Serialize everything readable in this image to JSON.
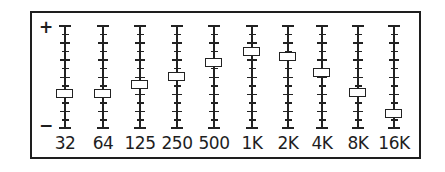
{
  "equalizer": {
    "max_label": "+",
    "min_label": "−",
    "colors": {
      "line": "#222222",
      "border": "#1e1e1e",
      "background": "#ffffff"
    },
    "bands": [
      {
        "label": "32",
        "knob_pct": 67,
        "level_db": -4
      },
      {
        "label": "64",
        "knob_pct": 67,
        "level_db": -4
      },
      {
        "label": "125",
        "knob_pct": 58,
        "level_db": -2
      },
      {
        "label": "250",
        "knob_pct": 50,
        "level_db": 0
      },
      {
        "label": "500",
        "knob_pct": 37,
        "level_db": 3
      },
      {
        "label": "1K",
        "knob_pct": 26,
        "level_db": 6
      },
      {
        "label": "2K",
        "knob_pct": 31,
        "level_db": 4.5
      },
      {
        "label": "4K",
        "knob_pct": 47,
        "level_db": 1
      },
      {
        "label": "8K",
        "knob_pct": 66,
        "level_db": -4
      },
      {
        "label": "16K",
        "knob_pct": 86,
        "level_db": -9
      }
    ]
  }
}
